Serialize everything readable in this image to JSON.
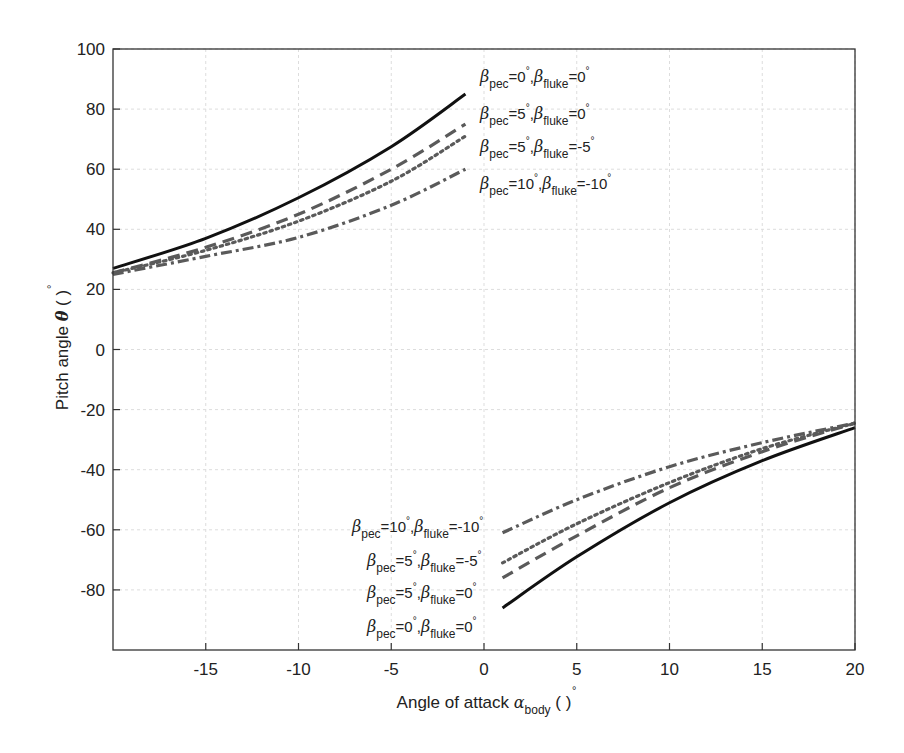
{
  "chart_data": {
    "type": "line",
    "title": "",
    "xlabel": "Angle of attack α_body (°)",
    "xlabel_parts": {
      "main": "Angle of attack ",
      "symbol": "α",
      "sub": "body",
      "unit": " ( )",
      "deg": "°"
    },
    "ylabel": "Pitch angle θ (°)",
    "ylabel_parts": {
      "main": "Pitch angle ",
      "symbol": "θ",
      "unit": " ( )",
      "deg": "°"
    },
    "xlim": [
      -20,
      20
    ],
    "ylim": [
      -100,
      100
    ],
    "xticks": [
      -15,
      -10,
      -5,
      0,
      5,
      10,
      15,
      20
    ],
    "xtick_labels": [
      "-15",
      "-10",
      "-5",
      "0",
      "5",
      "10",
      "15",
      "20"
    ],
    "yticks": [
      -80,
      -60,
      -40,
      -20,
      0,
      20,
      40,
      60,
      80,
      100
    ],
    "ytick_labels": [
      "-80",
      "-60",
      "-40",
      "-20",
      "0",
      "20",
      "40",
      "60",
      "80",
      "100"
    ],
    "grid": true,
    "legend_position": "inline annotations next to curve ends",
    "series": [
      {
        "name": "β_pec=0°, β_fluke=0°",
        "style": "solid",
        "color": "#111111",
        "negative_branch": {
          "x": [
            -20,
            -15,
            -10,
            -5,
            -1
          ],
          "y": [
            27,
            37,
            50.5,
            67.5,
            85
          ]
        },
        "positive_branch": {
          "x": [
            1,
            5,
            10,
            15,
            20
          ],
          "y": [
            -86,
            -69,
            -51,
            -37,
            -26
          ]
        }
      },
      {
        "name": "β_pec=5°, β_fluke=0°",
        "style": "dashed",
        "color": "#5a5a5a",
        "negative_branch": {
          "x": [
            -20,
            -15,
            -10,
            -5,
            -1
          ],
          "y": [
            25.5,
            34,
            45,
            60,
            75
          ]
        },
        "positive_branch": {
          "x": [
            1,
            5,
            10,
            15,
            20
          ],
          "y": [
            -76,
            -62,
            -46,
            -34,
            -24.5
          ]
        }
      },
      {
        "name": "β_pec=5°, β_fluke=-5°",
        "style": "dotted",
        "color": "#5a5a5a",
        "negative_branch": {
          "x": [
            -20,
            -15,
            -10,
            -5,
            -1
          ],
          "y": [
            25.5,
            33,
            42.7,
            56,
            71
          ]
        },
        "positive_branch": {
          "x": [
            1,
            5,
            10,
            15,
            20
          ],
          "y": [
            -71,
            -58,
            -44.3,
            -33,
            -24.5
          ]
        }
      },
      {
        "name": "β_pec=10°, β_fluke=-10°",
        "style": "dashdot",
        "color": "#5a5a5a",
        "negative_branch": {
          "x": [
            -20,
            -15,
            -10,
            -5,
            -1
          ],
          "y": [
            25,
            31,
            37.3,
            48,
            60
          ]
        },
        "positive_branch": {
          "x": [
            1,
            5,
            10,
            15,
            20
          ],
          "y": [
            -61,
            -50,
            -39,
            -31,
            -24.5
          ]
        }
      }
    ],
    "annotations": {
      "upper": [
        {
          "pec": "0",
          "fluke": "0",
          "x": 480,
          "y": 82
        },
        {
          "pec": "5",
          "fluke": "0",
          "x": 480,
          "y": 119
        },
        {
          "pec": "5",
          "fluke": "-5",
          "x": 480,
          "y": 152
        },
        {
          "pec": "10",
          "fluke": "-10",
          "x": 480,
          "y": 189
        }
      ],
      "lower": [
        {
          "pec": "10",
          "fluke": "-10",
          "x": 352,
          "y": 532
        },
        {
          "pec": "5",
          "fluke": "-5",
          "x": 367,
          "y": 566
        },
        {
          "pec": "5",
          "fluke": "0",
          "x": 367,
          "y": 598
        },
        {
          "pec": "0",
          "fluke": "0",
          "x": 367,
          "y": 632
        }
      ],
      "beta_symbol": "β",
      "pec_sub": "pec",
      "fluke_sub": "fluke",
      "deg": "°"
    }
  }
}
